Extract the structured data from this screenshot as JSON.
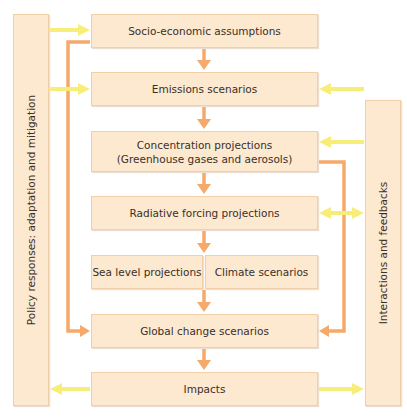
{
  "diagram": {
    "left_panel": {
      "label": "Policy responses: adaptation and mitigation"
    },
    "right_panel": {
      "label": "Interactions and feedbacks"
    },
    "boxes": {
      "socio": "Socio-economic assumptions",
      "emissions": "Emissions scenarios",
      "concentration_line1": "Concentration projections",
      "concentration_line2": "(Greenhouse gases and aerosols)",
      "radiative": "Radiative forcing projections",
      "sea_level": "Sea level projections",
      "climate": "Climate scenarios",
      "global": "Global change scenarios",
      "impacts": "Impacts"
    },
    "colors": {
      "box_fill": "#fde8d0",
      "flow_arrow": "#f5a96a",
      "feedback_arrow": "#f7ee7a"
    }
  }
}
